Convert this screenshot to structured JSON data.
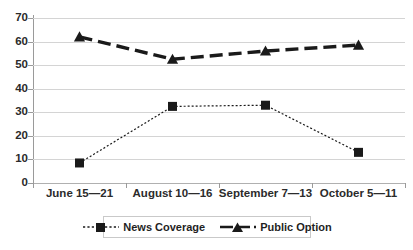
{
  "chart_data": {
    "type": "line",
    "title": "",
    "subtitle": "",
    "xlabel": "",
    "ylabel": "",
    "ylim": [
      0,
      70
    ],
    "ytick_step": 10,
    "yticks": [
      "0",
      "10",
      "20",
      "30",
      "40",
      "50",
      "60",
      "70"
    ],
    "grid": true,
    "legend_position": "bottom",
    "categories": [
      "June 15—21",
      "August 10—16",
      "September 7—13",
      "October 5—11"
    ],
    "series": [
      {
        "name": "News Coverage",
        "values": [
          8.5,
          32.5,
          33,
          13
        ],
        "marker": "square",
        "line_style": "dotted",
        "color": "#1a1a1a"
      },
      {
        "name": "Public Option",
        "values": [
          62,
          52.5,
          56,
          58.5
        ],
        "marker": "triangle",
        "line_style": "dashed",
        "color": "#1a1a1a"
      }
    ]
  },
  "axis": {
    "y_labels": [
      "70",
      "60",
      "50",
      "40",
      "30",
      "20",
      "10",
      "0"
    ],
    "x_labels": [
      "June 15—21",
      "August 10—16",
      "September 7—13",
      "October 5—11"
    ]
  },
  "legend": {
    "items": [
      {
        "label": "News Coverage",
        "marker": "square-marker-icon",
        "style": "dotted"
      },
      {
        "label": "Public Option",
        "marker": "triangle-marker-icon",
        "style": "dashed"
      }
    ]
  },
  "colors": {
    "series": "#1a1a1a",
    "gridline": "#d4d4d4",
    "axis": "#9a9a9a",
    "text": "#2b2b2b",
    "background": "#ffffff",
    "legend_border": "#c9c9c9"
  }
}
